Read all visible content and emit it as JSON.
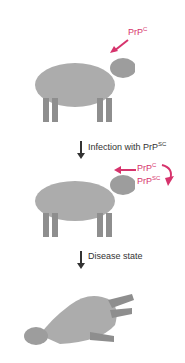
{
  "diagram": {
    "stages": [
      {
        "name": "healthy-sheep",
        "label_main": "PrP",
        "label_sup": "C"
      },
      {
        "name": "infected-sheep",
        "label1_main": "PrP",
        "label1_sup": "C",
        "label2_main": "PrP",
        "label2_sup": "SC"
      },
      {
        "name": "diseased-sheep"
      }
    ],
    "steps": [
      {
        "text": "Infection with PrP",
        "sup": "SC"
      },
      {
        "text": "Disease state"
      }
    ],
    "colors": {
      "accent": "#d6336c",
      "sheep": "#a9a9a9",
      "sheep_dark": "#8a8a8a",
      "arrow": "#333333"
    }
  }
}
